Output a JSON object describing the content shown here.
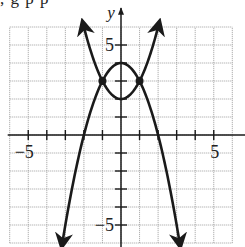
{
  "header_cutoff_text": ", g p                     p",
  "chart_data": {
    "type": "line",
    "title": "",
    "xlabel": "x",
    "ylabel": "y",
    "xlim": [
      -6,
      6
    ],
    "ylim": [
      -6,
      6
    ],
    "grid": true,
    "grid_step": 1,
    "x_tick_labels": [
      {
        "value": -5,
        "label": "−5"
      },
      {
        "value": 5,
        "label": "5"
      }
    ],
    "y_tick_labels": [
      {
        "value": 5,
        "label": "5"
      },
      {
        "value": -5,
        "label": "−5"
      }
    ],
    "series": [
      {
        "name": "f(x) = x^2 + 2",
        "shape": "upward parabola",
        "vertex": [
          0,
          2
        ],
        "x": [
          -2,
          -1,
          0,
          1,
          2
        ],
        "y": [
          6,
          3,
          2,
          3,
          6
        ],
        "arrows": "both ends"
      },
      {
        "name": "g(x) = -x^2 + 4",
        "shape": "downward parabola",
        "vertex": [
          0,
          4
        ],
        "x": [
          -3,
          -2,
          -1,
          0,
          1,
          2,
          3
        ],
        "y": [
          -5,
          0,
          3,
          4,
          3,
          0,
          -5
        ],
        "arrows": "both ends"
      }
    ],
    "points": [
      {
        "label": "intersection",
        "x": -1,
        "y": 3
      },
      {
        "label": "intersection",
        "x": 1,
        "y": 3
      }
    ],
    "colors": {
      "curve": "#1a1a1a",
      "grid": "#9a9a9a",
      "axis": "#1a1a1a",
      "background": "#ffffff"
    }
  }
}
